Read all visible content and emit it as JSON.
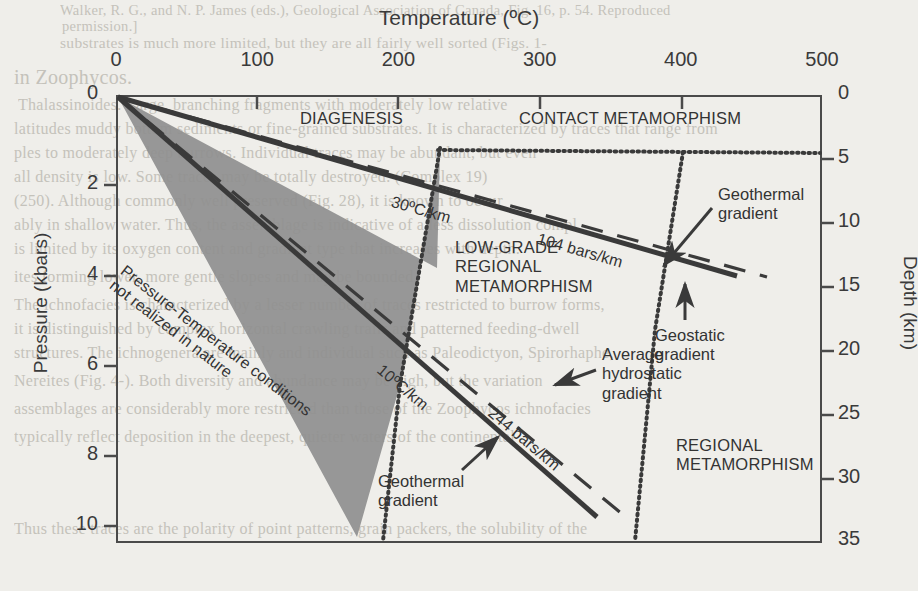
{
  "figure": {
    "title": "Temperature (ºC)",
    "ylabel_left": "Pressure (kbars)",
    "ylabel_right": "Depth (km)"
  },
  "background_text": {
    "lines": [
      "Walker, R. G., and N. P. James (eds.), Geological Association of Canada, Fig. 16, p. 54. Reproduced",
      "permission.]",
      "substrates is much more limited, but they are all fairly well sorted (Figs. 1-",
      "in Zoophycos.",
      "Thalassinoides. Large, branching fragments with moderately low relative",
      "latitudes muddy bottom sediments or fine-grained substrates. It is characterized by traces that range from",
      "ples to moderately deep burrows. Individual traces may be abundant, but even",
      "all density is low. Some traces may be totally destroyed. (Complex 19)",
      "(250). Although commonly well preserved (Fig. 28), it is known to occur",
      "ably in shallow water. Thus, the assemblage is indicative of a less dissolution compl",
      "is limited by its oxygen content and gradient type that increases with depth.",
      "ites forming lower, more gentle slopes and may be bounded",
      "The ichnofacies is characterized by a lesser number of traces restricted to burrow forms,",
      "it is distinguished by complex horizontal crawling trails and patterned feeding-dwell",
      "structures. The ichnogenera are mainly and individual such as Paleodictyon, Spirorhaphe,",
      "Nereites (Fig. 4-). Both diversity and abundance may be high, but the variation",
      "assemblages are considerably more restricted than those of the Zoophycos ichnofacies",
      "typically reflect deposition in the deepest, quieter waters of the continental",
      "Thus these traces are the polarity of point patterns, grain packers, the solubility of the"
    ]
  },
  "axes": {
    "x": {
      "label": "Temperature (ºC)",
      "ticks": [
        0,
        100,
        200,
        300,
        400,
        500
      ],
      "range": [
        0,
        500
      ],
      "unit": "ºC"
    },
    "y_left": {
      "label": "Pressure (kbars)",
      "ticks": [
        0,
        2,
        4,
        6,
        8,
        10
      ],
      "range": [
        0,
        10
      ],
      "unit": "kbars"
    },
    "y_right": {
      "label": "Depth (km)",
      "ticks": [
        0,
        5,
        10,
        15,
        20,
        25,
        30,
        35
      ],
      "range": [
        0,
        35
      ],
      "unit": "km"
    }
  },
  "chart_data": {
    "type": "line",
    "title": "Temperature (ºC)",
    "xlabel": "Temperature (ºC)",
    "ylabel": "Pressure (kbars)",
    "ylabel_secondary": "Depth (km)",
    "xlim": [
      0,
      500
    ],
    "ylim": [
      0,
      10
    ],
    "ylim_secondary": [
      0,
      35
    ],
    "grid": false,
    "legend": "none",
    "y_axis_inverted": true,
    "series": [
      {
        "name": "30ºC/km geothermal gradient",
        "style": "solid",
        "label": "30ºC/km",
        "points": [
          [
            0,
            0
          ],
          [
            438,
            12.9
          ]
        ],
        "note": "upper bound of diagenesis wedge; solid thick line from origin"
      },
      {
        "name": "10ºC/km geothermal gradient",
        "style": "solid",
        "label": "10ºC/km",
        "points": [
          [
            0,
            0
          ],
          [
            339,
            30.0
          ]
        ],
        "note": "lower bound of diagenesis wedge; solid thick line from origin"
      },
      {
        "name": "104 bars/km average hydrostatic gradient",
        "style": "dashed",
        "label": "104 bars/km",
        "points": [
          [
            0,
            0
          ],
          [
            460,
            12.6
          ]
        ]
      },
      {
        "name": "244 bars/km geostatic gradient",
        "style": "dashed",
        "label": "244 bars/km",
        "points": [
          [
            0,
            0
          ],
          [
            360,
            29.6
          ]
        ]
      },
      {
        "name": "contact/regional metamorphism upper boundary",
        "style": "dotted",
        "points": [
          [
            228,
            1.42
          ],
          [
            500,
            1.42
          ]
        ],
        "note": "horizontal dotted boundary at about 5 km depth"
      },
      {
        "name": "diagenesis / low-grade regional metamorphism boundary",
        "style": "dotted",
        "points": [
          [
            228,
            1.42
          ],
          [
            200,
            10.0
          ]
        ],
        "note": "near-vertical dotted boundary near 200-230 ºC"
      },
      {
        "name": "low-grade / regional metamorphism boundary",
        "style": "dotted",
        "points": [
          [
            400,
            1.42
          ],
          [
            367,
            10.0
          ]
        ],
        "note": "near-vertical dotted boundary near 400 ºC"
      }
    ],
    "shaded_regions": [
      {
        "name": "DIAGENESIS",
        "color": "#8c8c8c",
        "vertices": [
          [
            0,
            0
          ],
          [
            438,
            12.9
          ],
          [
            228,
            1.42
          ],
          [
            200,
            10.0
          ],
          [
            339,
            30.0
          ]
        ],
        "note": "grey wedge between the 30ºC/km and 10ºC/km gradients, left of the ~200ºC dotted boundary"
      }
    ],
    "field_labels": [
      "DIAGENESIS",
      "CONTACT METAMORPHISM",
      "LOW-GRADE REGIONAL METAMORPHISM",
      "REGIONAL METAMORPHISM",
      "Pressure-Temperature conditions not realized in nature"
    ]
  },
  "annotations": {
    "diagenesis": "DIAGENESIS",
    "contact_metamorphism": "CONTACT METAMORPHISM",
    "low_grade_regional": "LOW-GRADE\nREGIONAL\nMETAMORPHISM",
    "regional_metamorphism": "REGIONAL\nMETAMORPHISM",
    "not_realized": "Pressure-Temperature conditions\nnot realized in nature",
    "grad_30": "30ºC/km",
    "grad_10": "10ºC/km",
    "bars_104": "104 bars/km",
    "bars_244": "244 bars/km",
    "geothermal_gradient_top": "Geothermal\ngradient",
    "geostatic_gradient": "Geostatic\ngradient",
    "avg_hydrostatic": "Average\nhydrostatic\ngradient",
    "geothermal_gradient_bottom": "Geothermal\ngradient"
  },
  "colors": {
    "paper": "#efeeea",
    "ink": "#2b2b2b",
    "axis": "#4a4a4a",
    "shade": "#8c8c8c",
    "bg_text": "#b9b6ae"
  }
}
